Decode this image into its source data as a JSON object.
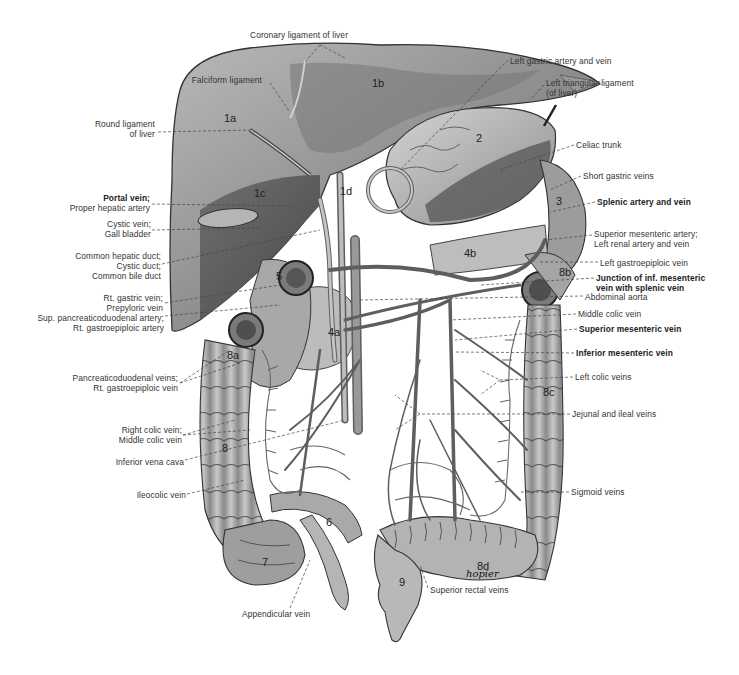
{
  "figure": {
    "type": "anatomical illustration",
    "signature": "hopier",
    "organ_numbers": [
      {
        "id": "1a",
        "x": 224,
        "y": 112
      },
      {
        "id": "1b",
        "x": 372,
        "y": 77
      },
      {
        "id": "1c",
        "x": 254,
        "y": 187
      },
      {
        "id": "1d",
        "x": 340,
        "y": 185
      },
      {
        "id": "2",
        "x": 476,
        "y": 132
      },
      {
        "id": "3",
        "x": 556,
        "y": 195
      },
      {
        "id": "4a",
        "x": 328,
        "y": 326
      },
      {
        "id": "4b",
        "x": 464,
        "y": 247
      },
      {
        "id": "5",
        "x": 276,
        "y": 270
      },
      {
        "id": "6",
        "x": 326,
        "y": 516
      },
      {
        "id": "7",
        "x": 262,
        "y": 556
      },
      {
        "id": "8",
        "x": 222,
        "y": 442
      },
      {
        "id": "8a",
        "x": 227,
        "y": 349
      },
      {
        "id": "8b",
        "x": 559,
        "y": 266
      },
      {
        "id": "8c",
        "x": 543,
        "y": 386
      },
      {
        "id": "8d",
        "x": 477,
        "y": 560
      },
      {
        "id": "9",
        "x": 399,
        "y": 576
      }
    ]
  },
  "labels": {
    "left": [
      {
        "lines": [
          "Falciform ligament"
        ],
        "x": 176,
        "y": 80,
        "bold": [
          false
        ]
      },
      {
        "lines": [
          "Round ligament",
          "of liver"
        ],
        "x": 155,
        "y": 120,
        "bold": [
          false,
          false
        ]
      },
      {
        "lines": [
          "Portal vein;",
          "Proper hepatic artery"
        ],
        "x": 150,
        "y": 194,
        "bold": [
          true,
          false
        ]
      },
      {
        "lines": [
          "Cystic vein;",
          "Gall bladder"
        ],
        "x": 151,
        "y": 220,
        "bold": [
          false,
          false
        ]
      },
      {
        "lines": [
          "Common hepatic duct;",
          "Cystic duct;",
          "Common bile duct"
        ],
        "x": 161,
        "y": 251,
        "bold": [
          false,
          false,
          false
        ]
      },
      {
        "lines": [
          "Rt. gastric vein;",
          "Prepyloric vein"
        ],
        "x": 163,
        "y": 293,
        "bold": [
          false,
          false
        ]
      },
      {
        "lines": [
          "Sup. pancreaticoduodenal artery;",
          "Rt. gastroepiploic artery"
        ],
        "x": 164,
        "y": 313,
        "bold": [
          false,
          false
        ]
      },
      {
        "lines": [
          "Pancreaticoduodenal veins;",
          "Rt. gastroepiploic vein"
        ],
        "x": 178,
        "y": 373,
        "bold": [
          false,
          false
        ]
      },
      {
        "lines": [
          "Right colic vein;",
          "Middle colic vein"
        ],
        "x": 182,
        "y": 425,
        "bold": [
          false,
          false
        ]
      },
      {
        "lines": [
          "Inferior vena cava"
        ],
        "x": 184,
        "y": 458,
        "bold": [
          false
        ]
      },
      {
        "lines": [
          "Ileocolic vein"
        ],
        "x": 186,
        "y": 491,
        "bold": [
          false
        ]
      }
    ],
    "top": [
      {
        "lines": [
          "Coronary ligament of liver"
        ],
        "x": 250,
        "y": 31,
        "bold": [
          false
        ]
      },
      {
        "lines": [
          "Left gastric artery and vein"
        ],
        "x": 510,
        "y": 56,
        "bold": [
          false
        ]
      },
      {
        "lines": [
          "Left triangular ligament",
          "(of liver)"
        ],
        "x": 546,
        "y": 78,
        "bold": [
          false,
          false
        ]
      }
    ],
    "right": [
      {
        "lines": [
          "Celiac trunk"
        ],
        "x": 576,
        "y": 141,
        "bold": [
          false
        ]
      },
      {
        "lines": [
          "Short gastric veins"
        ],
        "x": 583,
        "y": 172,
        "bold": [
          false
        ]
      },
      {
        "lines": [
          "Splenic artery and vein"
        ],
        "x": 597,
        "y": 198,
        "bold": [
          true
        ]
      },
      {
        "lines": [
          "Superior mesenteric artery;",
          "Left renal artery and vein"
        ],
        "x": 594,
        "y": 229,
        "bold": [
          false,
          false
        ]
      },
      {
        "lines": [
          "Left gastroepiploic vein"
        ],
        "x": 600,
        "y": 258,
        "bold": [
          false
        ]
      },
      {
        "lines": [
          "Junction of inf. mesenteric",
          "vein with splenic vein"
        ],
        "x": 596,
        "y": 273,
        "bold": [
          true,
          true
        ]
      },
      {
        "lines": [
          "Abdominal aorta"
        ],
        "x": 585,
        "y": 292,
        "bold": [
          false
        ]
      },
      {
        "lines": [
          "Middle colic vein"
        ],
        "x": 578,
        "y": 310,
        "bold": [
          false
        ]
      },
      {
        "lines": [
          "Superior mesenteric vein"
        ],
        "x": 579,
        "y": 325,
        "bold": [
          true
        ]
      },
      {
        "lines": [
          "Inferior mesenteric vein"
        ],
        "x": 576,
        "y": 349,
        "bold": [
          true
        ]
      },
      {
        "lines": [
          "Left colic veins"
        ],
        "x": 575,
        "y": 373,
        "bold": [
          false
        ]
      },
      {
        "lines": [
          "Jejunal and ileal veins"
        ],
        "x": 572,
        "y": 410,
        "bold": [
          false
        ]
      },
      {
        "lines": [
          "Sigmoid veins"
        ],
        "x": 571,
        "y": 488,
        "bold": [
          false
        ]
      }
    ],
    "bottom": [
      {
        "lines": [
          "Superior rectal veins"
        ],
        "x": 430,
        "y": 585,
        "bold": [
          false
        ]
      },
      {
        "lines": [
          "Appendicular vein"
        ],
        "x": 242,
        "y": 609,
        "bold": [
          false
        ]
      }
    ]
  },
  "colors": {
    "background": "#ffffff",
    "organ_light": "#c8c8c8",
    "organ_mid": "#9a9a9a",
    "organ_dark": "#5a5a5a",
    "vessel": "#8c8c8c",
    "outline": "#333333",
    "text": "#333333"
  }
}
